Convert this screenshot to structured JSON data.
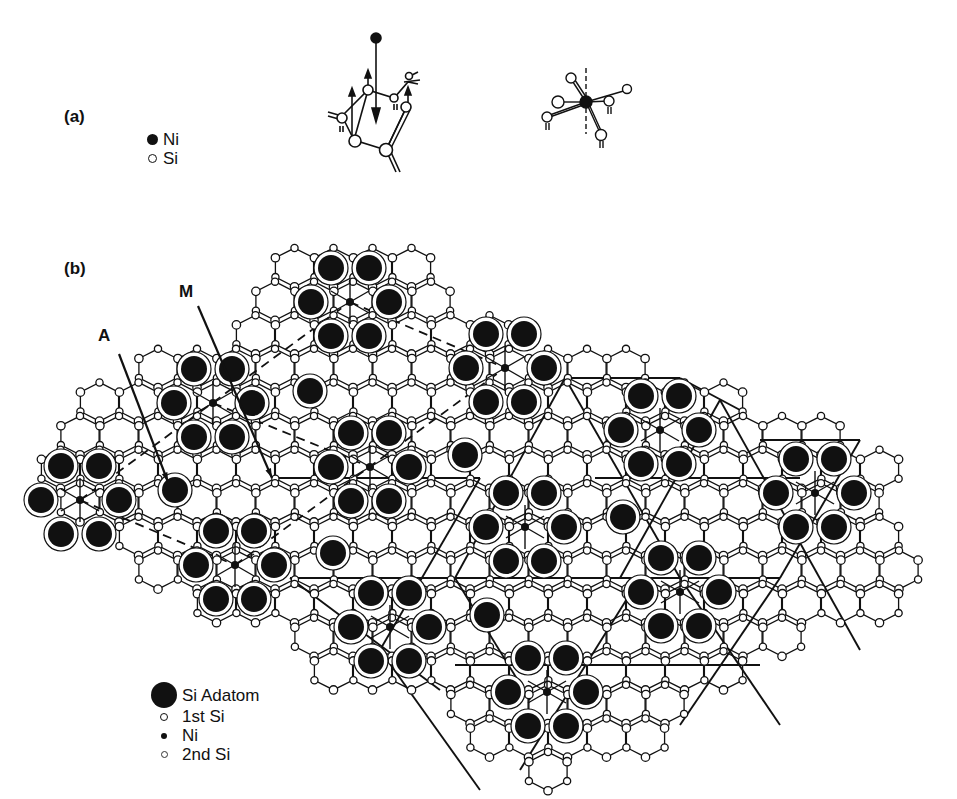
{
  "panel_a": {
    "label": "(a)",
    "legend": [
      {
        "symbol": "filled-circle",
        "text": "Ni"
      },
      {
        "symbol": "open-circle",
        "text": "Si"
      }
    ]
  },
  "panel_b": {
    "label": "(b)",
    "markers": [
      {
        "text": "A",
        "x": 104,
        "y": 330,
        "arrow_from": [
          119,
          354
        ],
        "arrow_to": [
          168,
          482
        ]
      },
      {
        "text": "M",
        "x": 185,
        "y": 283,
        "arrow_from": [
          198,
          306
        ],
        "arrow_to": [
          272,
          478
        ]
      }
    ],
    "legend": [
      {
        "symbol": "si-adatom",
        "text": "Si Adatom"
      },
      {
        "symbol": "first-si",
        "text": "1st Si"
      },
      {
        "symbol": "ni",
        "text": "Ni"
      },
      {
        "symbol": "second-si",
        "text": "2nd Si"
      }
    ],
    "lattice": {
      "dx": 39,
      "dy": 33.6,
      "origin": [
        41,
        301
      ],
      "hex_radius": 22.5
    },
    "ni_sites": [
      [
        350,
        302
      ],
      [
        213,
        403
      ],
      [
        505,
        368
      ],
      [
        370,
        467
      ],
      [
        80,
        500
      ],
      [
        660,
        430
      ],
      [
        235,
        565
      ],
      [
        525,
        527
      ],
      [
        815,
        493
      ],
      [
        680,
        592
      ],
      [
        390,
        627
      ],
      [
        547,
        692
      ]
    ],
    "extra_adatoms": [
      [
        310,
        391
      ],
      [
        175,
        490
      ],
      [
        465,
        455
      ],
      [
        333,
        553
      ],
      [
        623,
        517
      ],
      [
        487,
        615
      ]
    ],
    "colors": {
      "ink": "#111111",
      "paper": "#ffffff"
    }
  }
}
